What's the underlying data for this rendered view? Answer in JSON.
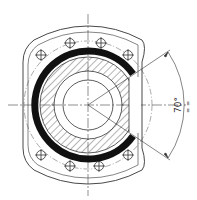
{
  "drawing": {
    "title": "Flange ball nut cross-section",
    "angle_label": "70°",
    "side_mark": "= =",
    "colors": {
      "line": "#333333",
      "fill": "#111111",
      "background": "#ffffff"
    },
    "bolt_holes_count": 8
  }
}
